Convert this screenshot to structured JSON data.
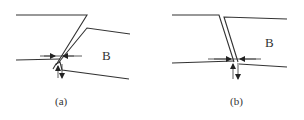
{
  "figure": {
    "panels": [
      {
        "id": "a",
        "caption": "(a)",
        "region_label": "B"
      },
      {
        "id": "b",
        "caption": "(b)",
        "region_label": "B"
      }
    ]
  }
}
